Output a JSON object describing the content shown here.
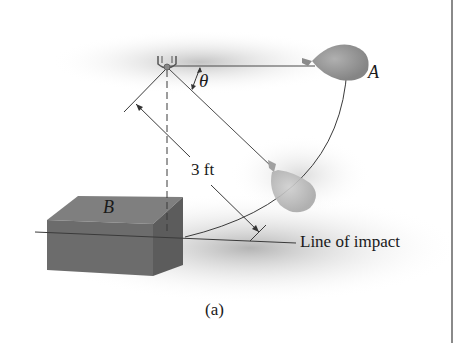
{
  "figure": {
    "caption": "(a)",
    "labels": {
      "balloon_A": "A",
      "block_B": "B",
      "angle": "θ",
      "length_dimension": "3 ft",
      "line_of_impact": "Line of impact"
    },
    "colors": {
      "background": "#ffffff",
      "shadow": "#c8c8c8",
      "block_top": "#7d7d7d",
      "block_front": "#6a6a6a",
      "block_side": "#5a5a5a",
      "balloon_A": "#9a9a9a",
      "balloon_lower": "#b8b8b8",
      "lines": "#3a3a3a",
      "border": "#8a8a8a"
    }
  }
}
